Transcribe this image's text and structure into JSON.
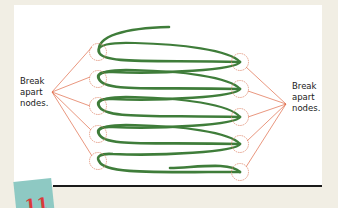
{
  "diagram": {
    "labels": {
      "left": [
        "Break",
        "apart",
        "nodes."
      ],
      "right": [
        "Break",
        "apart",
        "nodes."
      ]
    },
    "left_nodes": [
      {
        "x": 98,
        "y": 52
      },
      {
        "x": 98,
        "y": 79
      },
      {
        "x": 98,
        "y": 106
      },
      {
        "x": 98,
        "y": 134
      },
      {
        "x": 98,
        "y": 161
      }
    ],
    "right_nodes": [
      {
        "x": 240,
        "y": 62
      },
      {
        "x": 240,
        "y": 89
      },
      {
        "x": 240,
        "y": 117
      },
      {
        "x": 240,
        "y": 144
      },
      {
        "x": 240,
        "y": 172
      }
    ],
    "left_label_anchor": {
      "x": 52,
      "y": 92
    },
    "right_label_anchor": {
      "x": 286,
      "y": 104
    },
    "colors": {
      "spring": "#3f7d3a",
      "node_circle": "#e08a70",
      "leader_line": "#e06a48",
      "panel": "#ffffff",
      "background": "#f1eee4",
      "badge": "#8ec9c3",
      "badge_glyph": "#d93a3a",
      "rule": "#1a1a1a"
    }
  },
  "badge": {
    "glyph": "11"
  }
}
